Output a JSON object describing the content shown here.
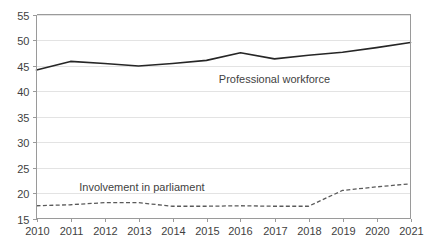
{
  "chart_data": {
    "type": "line",
    "title": "",
    "subtitle": "",
    "xlabel": "",
    "ylabel": "",
    "categories": [
      "2010",
      "2011",
      "2012",
      "2013",
      "2014",
      "2015",
      "2016",
      "2017",
      "2018",
      "2019",
      "2020",
      "2021"
    ],
    "x": [
      2010,
      2011,
      2012,
      2013,
      2014,
      2015,
      2016,
      2017,
      2018,
      2019,
      2020,
      2021
    ],
    "xlim": [
      2010,
      2021
    ],
    "ylim": [
      15,
      55
    ],
    "y_ticks": [
      15,
      20,
      25,
      30,
      35,
      40,
      45,
      50,
      55
    ],
    "x_ticks": [
      "2010",
      "2011",
      "2012",
      "2013",
      "2014",
      "2015",
      "2016",
      "2017",
      "2018",
      "2019",
      "2020",
      "2021"
    ],
    "grid": "horizontal",
    "legend": "inline-annotations",
    "series": [
      {
        "name": "Professional workforce",
        "style": "solid",
        "color": "#262626",
        "label_x": 2017.0,
        "label_y": 41.5,
        "values": [
          44.1,
          45.8,
          45.4,
          44.9,
          45.4,
          46.0,
          47.5,
          46.3,
          47.0,
          47.6,
          48.5,
          49.5
        ]
      },
      {
        "name": "Involvement in parliament",
        "style": "dashed",
        "color": "#5a5a5a",
        "label_x": 2013.1,
        "label_y": 20.3,
        "values": [
          17.5,
          17.7,
          18.1,
          18.1,
          17.4,
          17.4,
          17.5,
          17.4,
          17.4,
          20.5,
          21.2,
          21.8
        ]
      }
    ],
    "annotations": [
      {
        "text": "Professional workforce",
        "x": 2017.0,
        "y": 41.5
      },
      {
        "text": "Involvement in parliament",
        "x": 2013.1,
        "y": 20.3
      }
    ],
    "colors": {
      "grid": "#e3e3e3",
      "axis": "#9a9a9a",
      "text": "#3f3f3f",
      "background": "#ffffff"
    }
  }
}
